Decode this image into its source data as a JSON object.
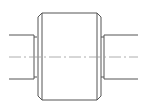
{
  "drawing": {
    "subject": "stepped shaft with cylindrical bushing (side view)",
    "line_color": "#555555",
    "centerline_color": "#9a9a9a",
    "background": "#ffffff"
  }
}
